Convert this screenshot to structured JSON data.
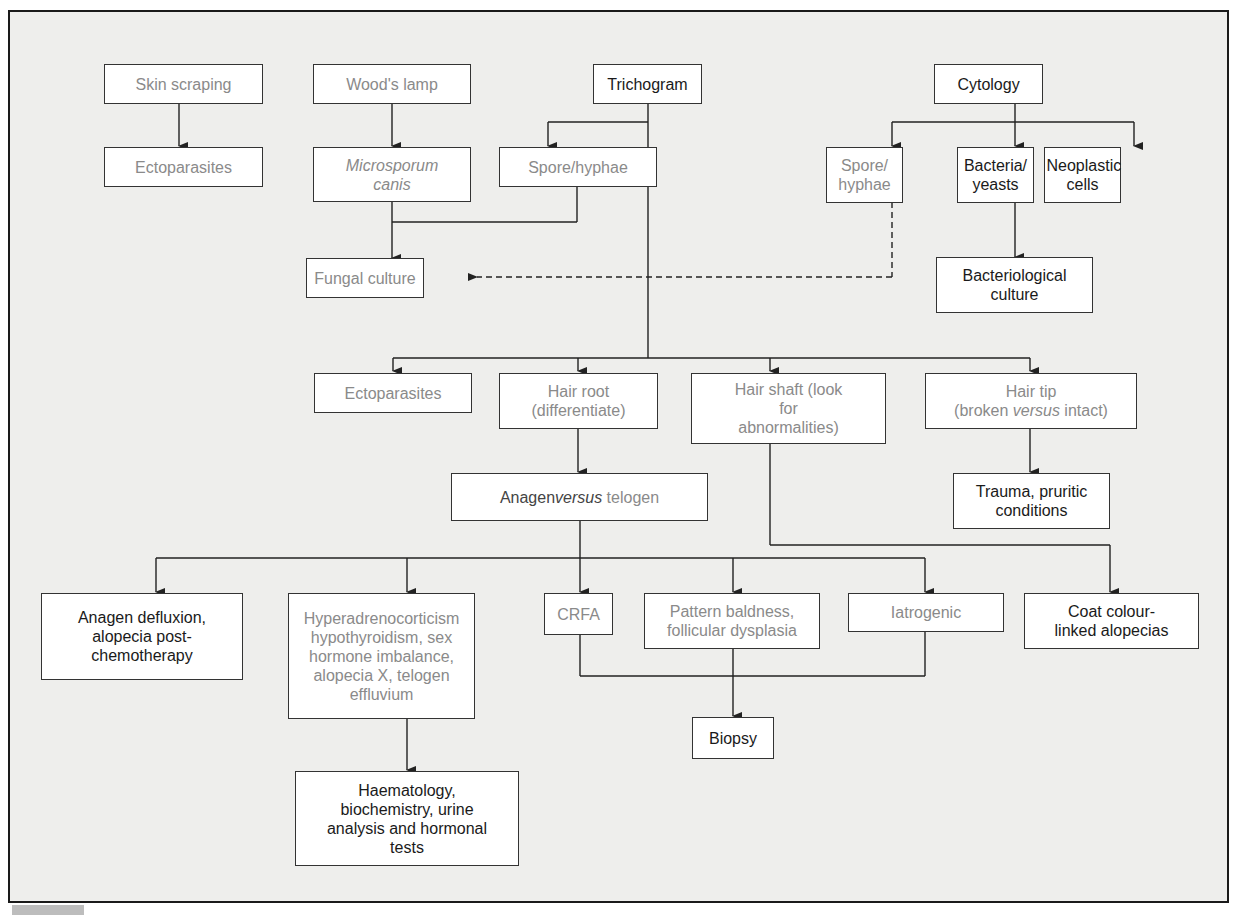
{
  "diagram": {
    "colors": {
      "background": "#eeeeec",
      "box_fill": "#ffffff",
      "border": "#333333",
      "text_dark": "#1a1a1a",
      "text_grey": "#8a8a8a"
    },
    "nodes": {
      "skin_scraping": "Skin scraping",
      "ectoparasites_1": "Ectoparasites",
      "woods_lamp": "Wood's lamp",
      "microsporum_canis": "Microsporum canis",
      "trichogram": "Trichogram",
      "spore_hyphae_1": "Spore/hyphae",
      "cytology": "Cytology",
      "spore_hyphae_2": "Spore/ hyphae",
      "bacteria_yeasts": "Bacteria/ yeasts",
      "neoplastic_cells": "Neoplastic cells",
      "fungal_culture": "Fungal culture",
      "bacteriological_culture": "Bacteriological culture",
      "ectoparasites_2": "Ectoparasites",
      "hair_root": "Hair root (differentiate)",
      "hair_shaft": "Hair shaft (look for abnormalities)",
      "hair_tip_a": "Hair tip",
      "hair_tip_b": "(broken ",
      "hair_tip_versus": "versus",
      "hair_tip_c": " intact)",
      "trauma": "Trauma, pruritic conditions",
      "anagen_a": "Anagen ",
      "anagen_versus": "versus",
      "anagen_b": " telogen",
      "anagen_defluxion": "Anagen defluxion, alopecia post-chemotherapy",
      "endocrine": "Hyperadrenocorticism hypothyroidism, sex hormone imbalance, alopecia X, telogen effluvium",
      "crfa": "CRFA",
      "pattern_baldness": "Pattern baldness, follicular dysplasia",
      "iatrogenic": "Iatrogenic",
      "coat_colour": "Coat colour-linked alopecias",
      "biopsy": "Biopsy",
      "haematology": "Haematology, biochemistry, urine analysis and hormonal tests"
    },
    "edges": [
      {
        "from": "Skin scraping",
        "to": "Ectoparasites",
        "style": "solid"
      },
      {
        "from": "Wood's lamp",
        "to": "Microsporum canis",
        "style": "solid"
      },
      {
        "from": "Trichogram",
        "to": "Spore/hyphae",
        "style": "solid"
      },
      {
        "from": "Microsporum canis",
        "to": "Fungal culture",
        "style": "solid"
      },
      {
        "from": "Spore/hyphae",
        "to": "Fungal culture",
        "style": "solid"
      },
      {
        "from": "Cytology",
        "to": "Spore/ hyphae",
        "style": "solid"
      },
      {
        "from": "Cytology",
        "to": "Bacteria/ yeasts",
        "style": "solid"
      },
      {
        "from": "Cytology",
        "to": "Neoplastic cells",
        "style": "solid"
      },
      {
        "from": "Spore/ hyphae",
        "to": "Fungal culture",
        "style": "dashed"
      },
      {
        "from": "Bacteria/ yeasts",
        "to": "Bacteriological culture",
        "style": "solid"
      },
      {
        "from": "Trichogram",
        "to": "Ectoparasites",
        "style": "solid"
      },
      {
        "from": "Trichogram",
        "to": "Hair root (differentiate)",
        "style": "solid"
      },
      {
        "from": "Trichogram",
        "to": "Hair shaft (look for abnormalities)",
        "style": "solid"
      },
      {
        "from": "Trichogram",
        "to": "Hair tip (broken versus intact)",
        "style": "solid"
      },
      {
        "from": "Hair tip (broken versus intact)",
        "to": "Trauma, pruritic conditions",
        "style": "solid"
      },
      {
        "from": "Hair root (differentiate)",
        "to": "Anagen versus telogen",
        "style": "solid"
      },
      {
        "from": "Hair shaft (look for abnormalities)",
        "to": "Coat colour-linked alopecias",
        "style": "solid"
      },
      {
        "from": "Anagen versus telogen",
        "to": "Anagen defluxion, alopecia post-chemotherapy",
        "style": "solid"
      },
      {
        "from": "Anagen versus telogen",
        "to": "Hyperadrenocorticism ...",
        "style": "solid"
      },
      {
        "from": "Anagen versus telogen",
        "to": "CRFA",
        "style": "solid"
      },
      {
        "from": "Anagen versus telogen",
        "to": "Pattern baldness, follicular dysplasia",
        "style": "solid"
      },
      {
        "from": "Anagen versus telogen",
        "to": "Iatrogenic",
        "style": "solid"
      },
      {
        "from": "CRFA",
        "to": "Biopsy",
        "style": "solid"
      },
      {
        "from": "Pattern baldness, follicular dysplasia",
        "to": "Biopsy",
        "style": "solid"
      },
      {
        "from": "Iatrogenic",
        "to": "Biopsy",
        "style": "solid"
      },
      {
        "from": "Hyperadrenocorticism ...",
        "to": "Haematology, biochemistry, urine analysis and hormonal tests",
        "style": "solid"
      }
    ]
  }
}
